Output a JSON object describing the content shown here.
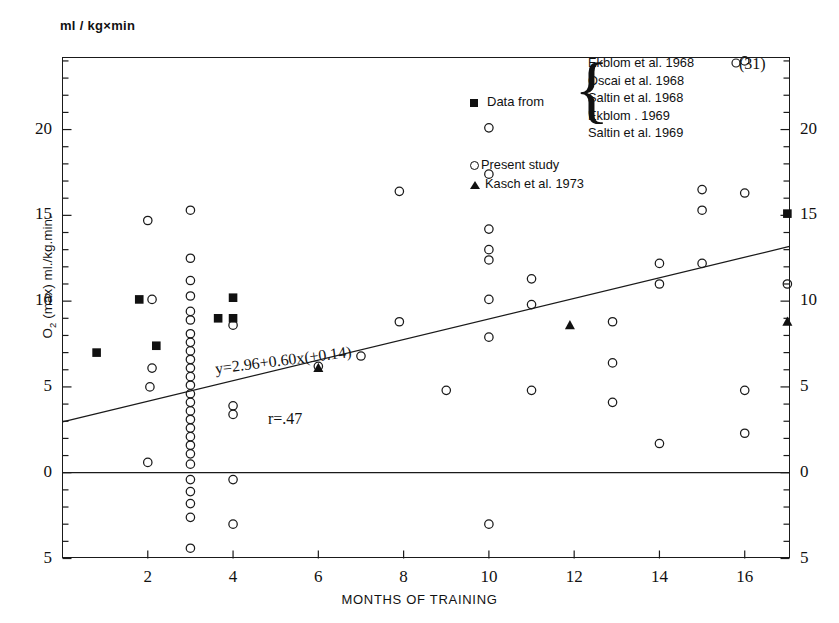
{
  "figure": {
    "unit_label": "ml / kg×min",
    "x_axis_title": "MONTHS OF TRAINING",
    "y_axis_title_parts": {
      "symbol": "O",
      "subscript": "2",
      "rest": " (max) ml./kg.min."
    },
    "equation": "y=2.96+0.60x(±0.14)",
    "correlation": "r=.47",
    "outlier_note": "(31)"
  },
  "legend": {
    "data_from_label": "Data from",
    "data_from_marker": "filled-square",
    "references": [
      "Ekblom et al. 1968",
      "Oscai et al. 1968",
      "Saltin et al. 1968",
      "Ekblom . 1969",
      "Saltin et al. 1969"
    ],
    "present_study_label": "Present study",
    "present_study_marker": "open-circle",
    "kasch_label": "Kasch et al. 1973",
    "kasch_marker": "filled-triangle"
  },
  "chart_data": {
    "type": "scatter",
    "title": "",
    "xlabel": "MONTHS OF TRAINING",
    "ylabel": "O2 (max) ml./kg.min.",
    "xlim": [
      0,
      17.05
    ],
    "ylim": [
      -5,
      24.2
    ],
    "xticks": [
      2,
      4,
      6,
      8,
      10,
      12,
      14,
      16
    ],
    "xticklabels": [
      "2",
      "4",
      "6",
      "8",
      "10",
      "12",
      "14",
      "16"
    ],
    "yticks": [
      -5,
      0,
      5,
      10,
      15,
      20
    ],
    "yticklabels": [
      "5",
      "0",
      "5",
      "10",
      "15",
      "20"
    ],
    "yticklabels_right": [
      "5",
      "0",
      "5",
      "10",
      "15",
      "20"
    ],
    "minor_ytick_step": 1,
    "grid": false,
    "zero_line": 0,
    "legend_position": "top-right",
    "regression": {
      "slope": 0.6,
      "intercept": 2.96,
      "slope_error": 0.14,
      "r": 0.47,
      "x_start": 0,
      "x_end": 17.05
    },
    "series": [
      {
        "name": "Present study",
        "marker": "open-circle",
        "points": [
          [
            2.0,
            14.7
          ],
          [
            2.1,
            10.1
          ],
          [
            2.1,
            6.1
          ],
          [
            2.05,
            5.0
          ],
          [
            2.0,
            0.6
          ],
          [
            3.0,
            15.3
          ],
          [
            3.0,
            12.5
          ],
          [
            3.0,
            11.2
          ],
          [
            3.0,
            10.3
          ],
          [
            3.0,
            9.4
          ],
          [
            3.0,
            8.9
          ],
          [
            3.0,
            8.1
          ],
          [
            3.0,
            7.6
          ],
          [
            3.0,
            7.1
          ],
          [
            3.0,
            6.6
          ],
          [
            3.0,
            6.1
          ],
          [
            3.0,
            5.6
          ],
          [
            3.0,
            5.1
          ],
          [
            3.0,
            4.6
          ],
          [
            3.0,
            4.1
          ],
          [
            3.0,
            3.6
          ],
          [
            3.0,
            3.1
          ],
          [
            3.0,
            2.6
          ],
          [
            3.0,
            2.1
          ],
          [
            3.0,
            1.6
          ],
          [
            3.0,
            1.1
          ],
          [
            3.0,
            0.5
          ],
          [
            3.0,
            -0.4
          ],
          [
            3.0,
            -1.1
          ],
          [
            3.0,
            -1.8
          ],
          [
            3.0,
            -2.6
          ],
          [
            3.0,
            -4.4
          ],
          [
            4.0,
            8.6
          ],
          [
            4.0,
            3.9
          ],
          [
            4.0,
            3.4
          ],
          [
            4.0,
            -0.4
          ],
          [
            4.0,
            -3.0
          ],
          [
            6.0,
            6.2
          ],
          [
            7.0,
            6.8
          ],
          [
            7.9,
            8.8
          ],
          [
            7.9,
            16.4
          ],
          [
            9.0,
            4.8
          ],
          [
            10.0,
            17.4
          ],
          [
            10.0,
            14.2
          ],
          [
            10.0,
            13.0
          ],
          [
            10.0,
            12.4
          ],
          [
            10.0,
            10.1
          ],
          [
            10.0,
            7.9
          ],
          [
            10.0,
            -3.0
          ],
          [
            10.0,
            20.1
          ],
          [
            11.0,
            11.3
          ],
          [
            11.0,
            9.8
          ],
          [
            11.0,
            4.8
          ],
          [
            12.9,
            8.8
          ],
          [
            12.9,
            6.4
          ],
          [
            12.9,
            4.1
          ],
          [
            14.0,
            12.2
          ],
          [
            14.0,
            11.0
          ],
          [
            14.0,
            1.7
          ],
          [
            15.0,
            16.5
          ],
          [
            15.0,
            15.3
          ],
          [
            15.0,
            12.2
          ],
          [
            16.0,
            16.3
          ],
          [
            16.0,
            4.8
          ],
          [
            16.0,
            2.3
          ],
          [
            17.0,
            11.0
          ]
        ]
      },
      {
        "name": "Data from (Ekblom/Oscai/Saltin)",
        "marker": "filled-square",
        "points": [
          [
            0.8,
            7.0
          ],
          [
            1.8,
            10.1
          ],
          [
            2.2,
            7.4
          ],
          [
            3.65,
            9.0
          ],
          [
            4.0,
            10.2
          ],
          [
            4.0,
            9.0
          ],
          [
            17.0,
            15.1
          ]
        ]
      },
      {
        "name": "Kasch et al. 1973",
        "marker": "filled-triangle",
        "points": [
          [
            6.0,
            6.1
          ],
          [
            11.9,
            8.6
          ],
          [
            17.0,
            8.8
          ]
        ]
      },
      {
        "name": "Off-scale point",
        "marker": "open-circle",
        "label": "(31)",
        "points": [
          [
            16.0,
            24.0
          ]
        ]
      }
    ]
  }
}
